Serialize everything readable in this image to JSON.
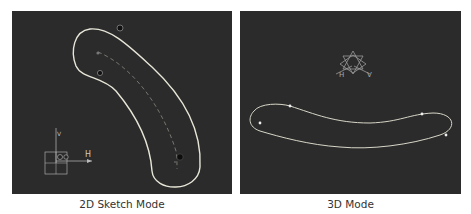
{
  "panels": [
    {
      "id": "2d-sketch",
      "caption": "2D Sketch Mode",
      "background": "#2b2b2b",
      "curve_color": "#e8e6d8",
      "axis_labels": {
        "horizontal": "H",
        "vertical": "V"
      }
    },
    {
      "id": "3d",
      "caption": "3D Mode",
      "background": "#2b2b2b",
      "curve_color": "#d8d6c8",
      "axis_labels": {
        "horizontal": "H",
        "vertical": "V"
      }
    }
  ]
}
